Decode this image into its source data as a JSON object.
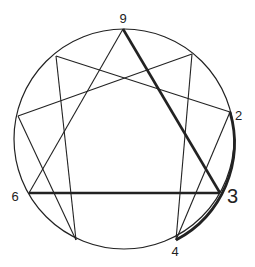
{
  "diagram": {
    "type": "enneagram",
    "circle": {
      "cx": 124,
      "cy": 139,
      "r": 110
    },
    "points": [
      {
        "id": "9",
        "x": 123,
        "y": 29
      },
      {
        "id": "1",
        "x": 192,
        "y": 54
      },
      {
        "id": "2",
        "x": 230,
        "y": 112
      },
      {
        "id": "3",
        "x": 220,
        "y": 193
      },
      {
        "id": "4",
        "x": 176,
        "y": 240
      },
      {
        "id": "5",
        "x": 76,
        "y": 240
      },
      {
        "id": "6",
        "x": 29,
        "y": 193
      },
      {
        "id": "7",
        "x": 18,
        "y": 116
      },
      {
        "id": "8",
        "x": 56,
        "y": 56
      }
    ],
    "labels": {
      "nine": "9",
      "two": "2",
      "three": "3",
      "four": "4",
      "six": "6"
    },
    "thin_lines": [
      [
        "8",
        "2"
      ],
      [
        "8",
        "5"
      ],
      [
        "1",
        "7"
      ],
      [
        "1",
        "4"
      ],
      [
        "9",
        "6"
      ],
      [
        "7",
        "5"
      ],
      [
        "2",
        "4"
      ]
    ],
    "bold_lines": [
      [
        "9",
        "3"
      ],
      [
        "6",
        "3"
      ]
    ],
    "bold_arc": {
      "from": "2",
      "via": "3",
      "to": "4"
    },
    "colors": {
      "stroke": "#222222",
      "background": "#ffffff"
    }
  }
}
